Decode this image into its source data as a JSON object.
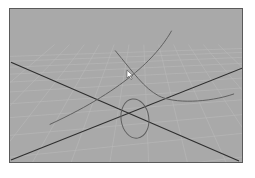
{
  "viewport": {
    "name": "perspective-viewport",
    "background_color": "#a9a9a9",
    "border_color": "#5a5a5a",
    "grid_color": "#b8b8b8",
    "axis_color": "#2e2e2e",
    "curve_color": "#5e5e5e"
  },
  "scene": {
    "axes": [
      {
        "name": "axis-line-x",
        "from": [
          1,
          54
        ],
        "to": [
          231,
          154
        ]
      },
      {
        "name": "axis-line-z",
        "from": [
          1,
          153
        ],
        "to": [
          234,
          60
        ]
      }
    ],
    "curves": [
      {
        "name": "nurbs-curve-long",
        "path": "M163 22 C 150 45, 120 80, 40 117"
      },
      {
        "name": "nurbs-curve-s",
        "path": "M106 42 C 125 65, 135 80, 150 88 S 200 95, 226 86"
      }
    ],
    "circle": {
      "name": "nurbs-circle",
      "cx": 126,
      "cy": 111,
      "rx": 14,
      "ry": 20,
      "rotate": -8
    },
    "cursor": {
      "x": 118,
      "y": 62
    }
  }
}
